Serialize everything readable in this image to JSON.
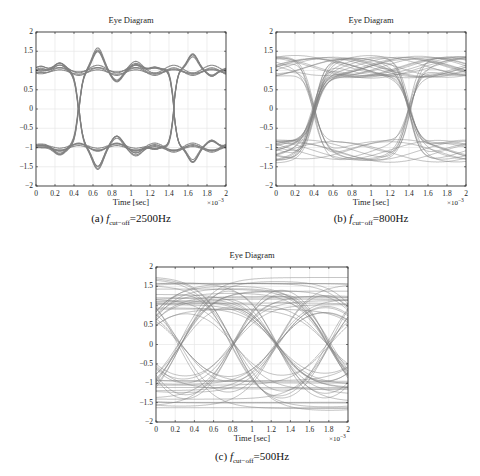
{
  "figure": {
    "line_color": "#808080",
    "grid_color": "#e6e6e6",
    "axis_color": "#262626"
  },
  "chart_data": [
    {
      "id": "a",
      "type": "line",
      "title": "Eye Diagram",
      "xlabel": "Time [sec]",
      "ylabel": "",
      "x_multiplier": "×10",
      "x_exponent": "−3",
      "xlim": [
        0,
        2
      ],
      "ylim": [
        -2,
        2
      ],
      "xticks": [
        "0",
        "0.2",
        "0.4",
        "0.6",
        "0.8",
        "1",
        "1.2",
        "1.4",
        "1.6",
        "1.8",
        "2"
      ],
      "yticks": [
        "2",
        "1.5",
        "1",
        "0.5",
        "0",
        "−0.5",
        "−1",
        "−1.5",
        "−2"
      ],
      "grid": true,
      "caption_prefix": "(a) ",
      "caption_var": "f",
      "caption_sub": "cut−off",
      "caption_value": "=2500Hz",
      "cutoff_hz": 2500,
      "eye_opening": "wide, levels ±1 with ringing overshoot to ±1.45",
      "crossings_x": [
        0.45,
        1.45
      ],
      "levels": [
        1,
        -1
      ],
      "overshoot_peak": 1.45,
      "trace_count": 16,
      "spread": 0.05
    },
    {
      "id": "b",
      "type": "line",
      "title": "Eye Diagram",
      "xlabel": "Time [sec]",
      "ylabel": "",
      "x_multiplier": "×10",
      "x_exponent": "−3",
      "xlim": [
        0,
        2
      ],
      "ylim": [
        -2,
        2
      ],
      "xticks": [
        "0",
        "0.2",
        "0.4",
        "0.6",
        "0.8",
        "1",
        "1.2",
        "1.4",
        "1.6",
        "1.8",
        "2"
      ],
      "yticks": [
        "2",
        "1.5",
        "1",
        "0.5",
        "0",
        "−0.5",
        "−1",
        "−1.5",
        "−2"
      ],
      "grid": true,
      "caption_prefix": "(b) ",
      "caption_var": "f",
      "caption_sub": "cut−off",
      "caption_value": "=800Hz",
      "cutoff_hz": 800,
      "eye_opening": "moderate, levels between ±0.75 and ±1.4",
      "crossings_x": [
        0.4,
        1.4
      ],
      "levels": [
        1,
        -1
      ],
      "overshoot_peak": 1.4,
      "trace_count": 40,
      "spread": 0.22
    },
    {
      "id": "c",
      "type": "line",
      "title": "Eye Diagram",
      "xlabel": "Time [sec]",
      "ylabel": "",
      "x_multiplier": "×10",
      "x_exponent": "−3",
      "xlim": [
        0,
        2
      ],
      "ylim": [
        -2,
        2
      ],
      "xticks": [
        "0",
        "0.2",
        "0.4",
        "0.6",
        "0.8",
        "1",
        "1.2",
        "1.4",
        "1.6",
        "1.8",
        "2"
      ],
      "yticks": [
        "2",
        "1.5",
        "1",
        "0.5",
        "0",
        "−0.5",
        "−1",
        "−1.5",
        "−2"
      ],
      "grid": true,
      "caption_prefix": "(c) ",
      "caption_var": "f",
      "caption_sub": "cut−off",
      "caption_value": "=500Hz",
      "cutoff_hz": 500,
      "eye_opening": "nearly closed, traces span −1.85 to 1.85",
      "crossings_x": [
        0.25,
        0.8,
        1.25,
        1.8
      ],
      "levels": [
        1,
        -1
      ],
      "overshoot_peak": 1.85,
      "trace_count": 60,
      "spread": 0.55
    }
  ]
}
